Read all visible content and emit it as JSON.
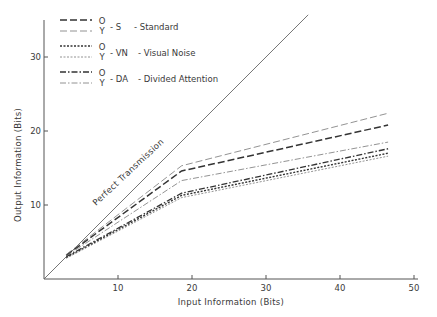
{
  "chart_data": {
    "type": "line",
    "title": "",
    "xlabel": "Input Information (Bits)",
    "ylabel": "Output Information (Bits)",
    "xlim": [
      0,
      50
    ],
    "ylim": [
      0,
      35
    ],
    "x_ticks": [
      10,
      20,
      30,
      40,
      50
    ],
    "y_ticks": [
      10,
      20,
      30
    ],
    "grid": false,
    "legend_position": "upper-left",
    "annotations": [
      {
        "text": "Perfect Transmission",
        "x": 9,
        "y": 12,
        "rotation": -43
      }
    ],
    "reference_line": {
      "name": "Perfect Transmission",
      "x": [
        0,
        35.7
      ],
      "y": [
        0,
        35.7
      ]
    },
    "series": [
      {
        "name": "O - S - Standard",
        "group": "O",
        "condition": "S",
        "style": "dashed-heavy",
        "x": [
          3,
          18.6,
          46.5
        ],
        "y": [
          3.2,
          14.6,
          20.8
        ]
      },
      {
        "name": "Y - S - Standard",
        "group": "Y",
        "condition": "S",
        "style": "dashed-light",
        "x": [
          3,
          18.6,
          46.5
        ],
        "y": [
          3.3,
          15.3,
          22.4
        ]
      },
      {
        "name": "O - VN - Visual Noise",
        "group": "O",
        "condition": "VN",
        "style": "dotted-heavy",
        "x": [
          3,
          18.6,
          46.5
        ],
        "y": [
          2.9,
          11.3,
          17.0
        ]
      },
      {
        "name": "Y - VN - Visual Noise",
        "group": "Y",
        "condition": "VN",
        "style": "dotted-light",
        "x": [
          3,
          18.6,
          46.5
        ],
        "y": [
          2.8,
          11.0,
          16.6
        ]
      },
      {
        "name": "O - DA - Divided Attention",
        "group": "O",
        "condition": "DA",
        "style": "dashdot-heavy",
        "x": [
          3,
          18.6,
          46.5
        ],
        "y": [
          3.0,
          11.6,
          17.6
        ]
      },
      {
        "name": "Y - DA - Divided Attention",
        "group": "Y",
        "condition": "DA",
        "style": "dashdot-light",
        "x": [
          3,
          18.6,
          46.5
        ],
        "y": [
          3.1,
          13.3,
          18.5
        ]
      }
    ]
  },
  "legend": {
    "rows": [
      {
        "o": "O",
        "y": "Y",
        "code": "- S",
        "label": "- Standard"
      },
      {
        "o": "O",
        "y": "Y",
        "code": "- VN",
        "label": "- Visual Noise"
      },
      {
        "o": "O",
        "y": "Y",
        "code": "- DA",
        "label": "- Divided Attention"
      }
    ]
  },
  "axes": {
    "xlabel": "Input Information (Bits)",
    "ylabel": "Output Information (Bits)",
    "x_tick_labels": [
      "10",
      "20",
      "30",
      "40",
      "50"
    ],
    "y_tick_labels": [
      "10",
      "20",
      "30"
    ],
    "annotation": "Perfect Transmission"
  }
}
